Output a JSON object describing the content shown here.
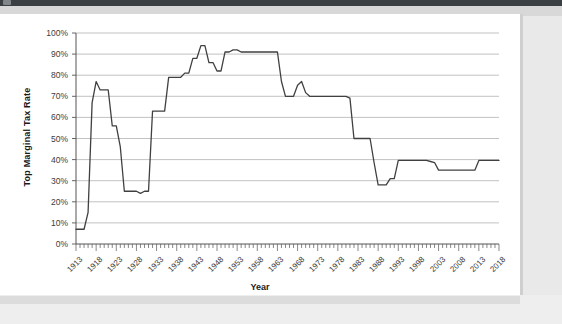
{
  "window": {
    "top_bar_color": "#3a3f43",
    "page_background": "#e9e9e9",
    "panel_background": "#ffffff"
  },
  "chart_data": {
    "type": "line",
    "title": "",
    "xlabel": "Year",
    "ylabel": "Top Marginal Tax Rate",
    "xlim": [
      1913,
      2018
    ],
    "ylim": [
      0,
      1.0
    ],
    "grid": true,
    "legend": null,
    "line_color": "#404040",
    "gridline_color": "#b3b3b3",
    "y_tick_labels": [
      "100%",
      "90%",
      "80%",
      "70%",
      "60%",
      "50%",
      "40%",
      "30%",
      "20%",
      "10%",
      "0%"
    ],
    "y_tick_values": [
      100,
      90,
      80,
      70,
      60,
      50,
      40,
      30,
      20,
      10,
      0
    ],
    "x_tick_labels": [
      "1913",
      "1918",
      "1923",
      "1928",
      "1933",
      "1938",
      "1943",
      "1948",
      "1953",
      "1958",
      "1963",
      "1968",
      "1973",
      "1978",
      "1983",
      "1988",
      "1993",
      "1998",
      "2003",
      "2008",
      "2013",
      "2018"
    ],
    "x_tick_values": [
      1913,
      1918,
      1923,
      1928,
      1933,
      1938,
      1943,
      1948,
      1953,
      1958,
      1963,
      1968,
      1973,
      1978,
      1983,
      1988,
      1993,
      1998,
      2003,
      2008,
      2013,
      2018
    ],
    "x": [
      1913,
      1914,
      1915,
      1916,
      1917,
      1918,
      1919,
      1920,
      1921,
      1922,
      1923,
      1924,
      1925,
      1926,
      1927,
      1928,
      1929,
      1930,
      1931,
      1932,
      1933,
      1934,
      1935,
      1936,
      1937,
      1938,
      1939,
      1940,
      1941,
      1942,
      1943,
      1944,
      1945,
      1946,
      1947,
      1948,
      1949,
      1950,
      1951,
      1952,
      1953,
      1954,
      1955,
      1956,
      1957,
      1958,
      1959,
      1960,
      1961,
      1962,
      1963,
      1964,
      1965,
      1966,
      1967,
      1968,
      1969,
      1970,
      1971,
      1972,
      1973,
      1974,
      1975,
      1976,
      1977,
      1978,
      1979,
      1980,
      1981,
      1982,
      1983,
      1984,
      1985,
      1986,
      1987,
      1988,
      1989,
      1990,
      1991,
      1992,
      1993,
      1994,
      1995,
      1996,
      1997,
      1998,
      1999,
      2000,
      2001,
      2002,
      2003,
      2004,
      2005,
      2006,
      2007,
      2008,
      2009,
      2010,
      2011,
      2012,
      2013,
      2014,
      2015,
      2016,
      2017,
      2018
    ],
    "values": [
      7,
      7,
      7,
      15,
      67,
      77,
      73,
      73,
      73,
      56,
      56,
      46,
      25,
      25,
      25,
      25,
      24,
      25,
      25,
      63,
      63,
      63,
      63,
      79,
      79,
      79,
      79,
      81,
      81,
      88,
      88,
      94,
      94,
      86,
      86,
      82,
      82,
      91,
      91,
      92,
      92,
      91,
      91,
      91,
      91,
      91,
      91,
      91,
      91,
      91,
      91,
      77,
      70,
      70,
      70,
      75.25,
      77,
      71.75,
      70,
      70,
      70,
      70,
      70,
      70,
      70,
      70,
      70,
      70,
      69.125,
      50,
      50,
      50,
      50,
      50,
      38.5,
      28,
      28,
      28,
      31,
      31,
      39.6,
      39.6,
      39.6,
      39.6,
      39.6,
      39.6,
      39.6,
      39.6,
      39.1,
      38.6,
      35,
      35,
      35,
      35,
      35,
      35,
      35,
      35,
      35,
      35,
      39.6,
      39.6,
      39.6,
      39.6,
      39.6,
      39.6
    ],
    "unit": "%"
  }
}
